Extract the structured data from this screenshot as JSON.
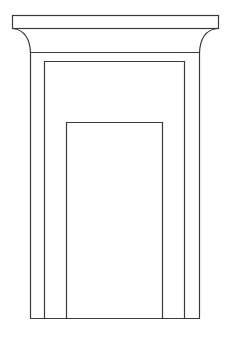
{
  "diagram": {
    "stroke_color": "#3a3a3a",
    "background": "#ffffff",
    "parts": [
      {
        "name": "cornice",
        "label": "Cavetto cornice"
      },
      {
        "name": "outer-frame",
        "label": "Outer jamb frame"
      },
      {
        "name": "inner-frame",
        "label": "Inner jamb frame"
      },
      {
        "name": "door-opening",
        "label": "Door opening"
      }
    ]
  }
}
